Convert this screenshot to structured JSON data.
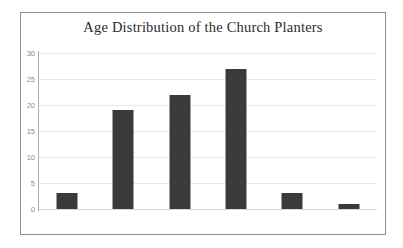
{
  "chart_data": {
    "type": "bar",
    "title": "Age Distribution of the Church Planters",
    "categories": [
      "20-29",
      "30-39",
      "40-49",
      "50-59",
      "60-69",
      "70+"
    ],
    "values": [
      3,
      19,
      22,
      27,
      3,
      1
    ],
    "xlabel": "",
    "ylabel": "",
    "ylim": [
      0,
      30
    ],
    "yticks": [
      0,
      5,
      10,
      15,
      20,
      25,
      30
    ],
    "ytick_labels": [
      "0",
      "5",
      "10",
      "15",
      "20",
      "25",
      "30"
    ],
    "grid": true,
    "legend": false,
    "bar_color": "#3a3a3a",
    "grid_color": "#e8e8e8",
    "axis_color": "#b0b0b0",
    "tick_text_color": "#8a8a8a",
    "title_color": "#2b2b2b",
    "frame_color": "#8f8f8f",
    "background_color": "#ffffff"
  }
}
